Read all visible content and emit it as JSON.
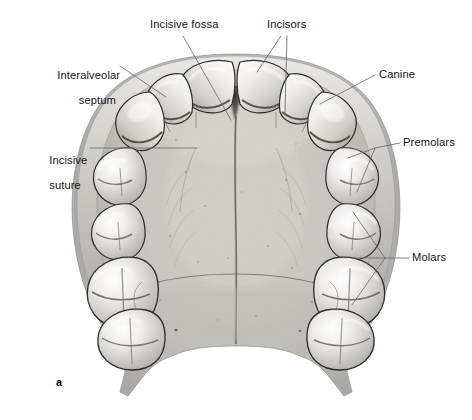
{
  "figure": {
    "letter": "a",
    "background_color": "#ffffff",
    "leader_color": "#6d6d6d",
    "text_color": "#141414"
  },
  "labels": [
    {
      "id": "incisive-fossa",
      "text": "Incisive fossa",
      "x": 150,
      "y": 18,
      "align": "left"
    },
    {
      "id": "incisors",
      "text": "Incisors",
      "x": 267,
      "y": 18,
      "align": "left"
    },
    {
      "id": "interalveolar-septum",
      "line1": "Interalveolar",
      "line2": "septum",
      "x": 38,
      "y": 56,
      "align": "right",
      "width": 78
    },
    {
      "id": "canine",
      "text": "Canine",
      "x": 379,
      "y": 68,
      "align": "left"
    },
    {
      "id": "premolars",
      "text": "Premolars",
      "x": 403,
      "y": 136,
      "align": "left"
    },
    {
      "id": "incisive-suture",
      "line1": "Incisive",
      "line2": "suture",
      "x": 30,
      "y": 141,
      "align": "left",
      "width": 55
    },
    {
      "id": "molars",
      "text": "Molars",
      "x": 412,
      "y": 251,
      "align": "left"
    }
  ],
  "anatomy_parts": [
    "incisors",
    "canine",
    "premolars",
    "molars",
    "incisive-fossa",
    "incisive-suture",
    "interalveolar-septum",
    "median-palatine-suture",
    "transverse-palatine-suture",
    "greater-palatine-foramen",
    "posterior-nasal-spine",
    "palatine-process",
    "alveolar-arch"
  ],
  "palette": {
    "bone_light": "#dcdad6",
    "bone_mid": "#c4c2bd",
    "bone_shadow": "#9b9995",
    "bone_deep": "#6e6c69",
    "tooth_light": "#f2f1ee",
    "tooth_mid": "#d8d6d1",
    "tooth_shadow": "#8d8b87",
    "outline": "#2e2d2b"
  }
}
